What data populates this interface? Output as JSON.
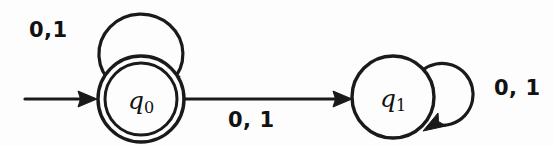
{
  "diagram": {
    "kind": "finite-state-automaton",
    "canvas": {
      "width": 554,
      "height": 146
    },
    "background_color": "#fdfdfd",
    "stroke_color": "#1a1a1a"
  },
  "states": [
    {
      "id": "q0",
      "label_main": "q",
      "label_sub": "0",
      "accepting": true,
      "start": true,
      "cx": 141,
      "cy": 99,
      "r_outer": 43,
      "r_inner": 36
    },
    {
      "id": "q1",
      "label_main": "q",
      "label_sub": "1",
      "accepting": false,
      "start": false,
      "cx": 393,
      "cy": 97,
      "r_outer": 41,
      "r_inner": 0
    }
  ],
  "transitions": [
    {
      "id": "start-arrow",
      "from": "",
      "to": "q0",
      "label": "",
      "kind": "start"
    },
    {
      "id": "loop-q0",
      "from": "q0",
      "to": "q0",
      "label": "0,1",
      "kind": "self-loop",
      "loop_position": "above"
    },
    {
      "id": "q0-to-q1",
      "from": "q0",
      "to": "q1",
      "label": "0, 1",
      "kind": "edge"
    },
    {
      "id": "loop-q1",
      "from": "q1",
      "to": "q1",
      "label": "0, 1",
      "kind": "self-loop",
      "loop_position": "right"
    }
  ]
}
